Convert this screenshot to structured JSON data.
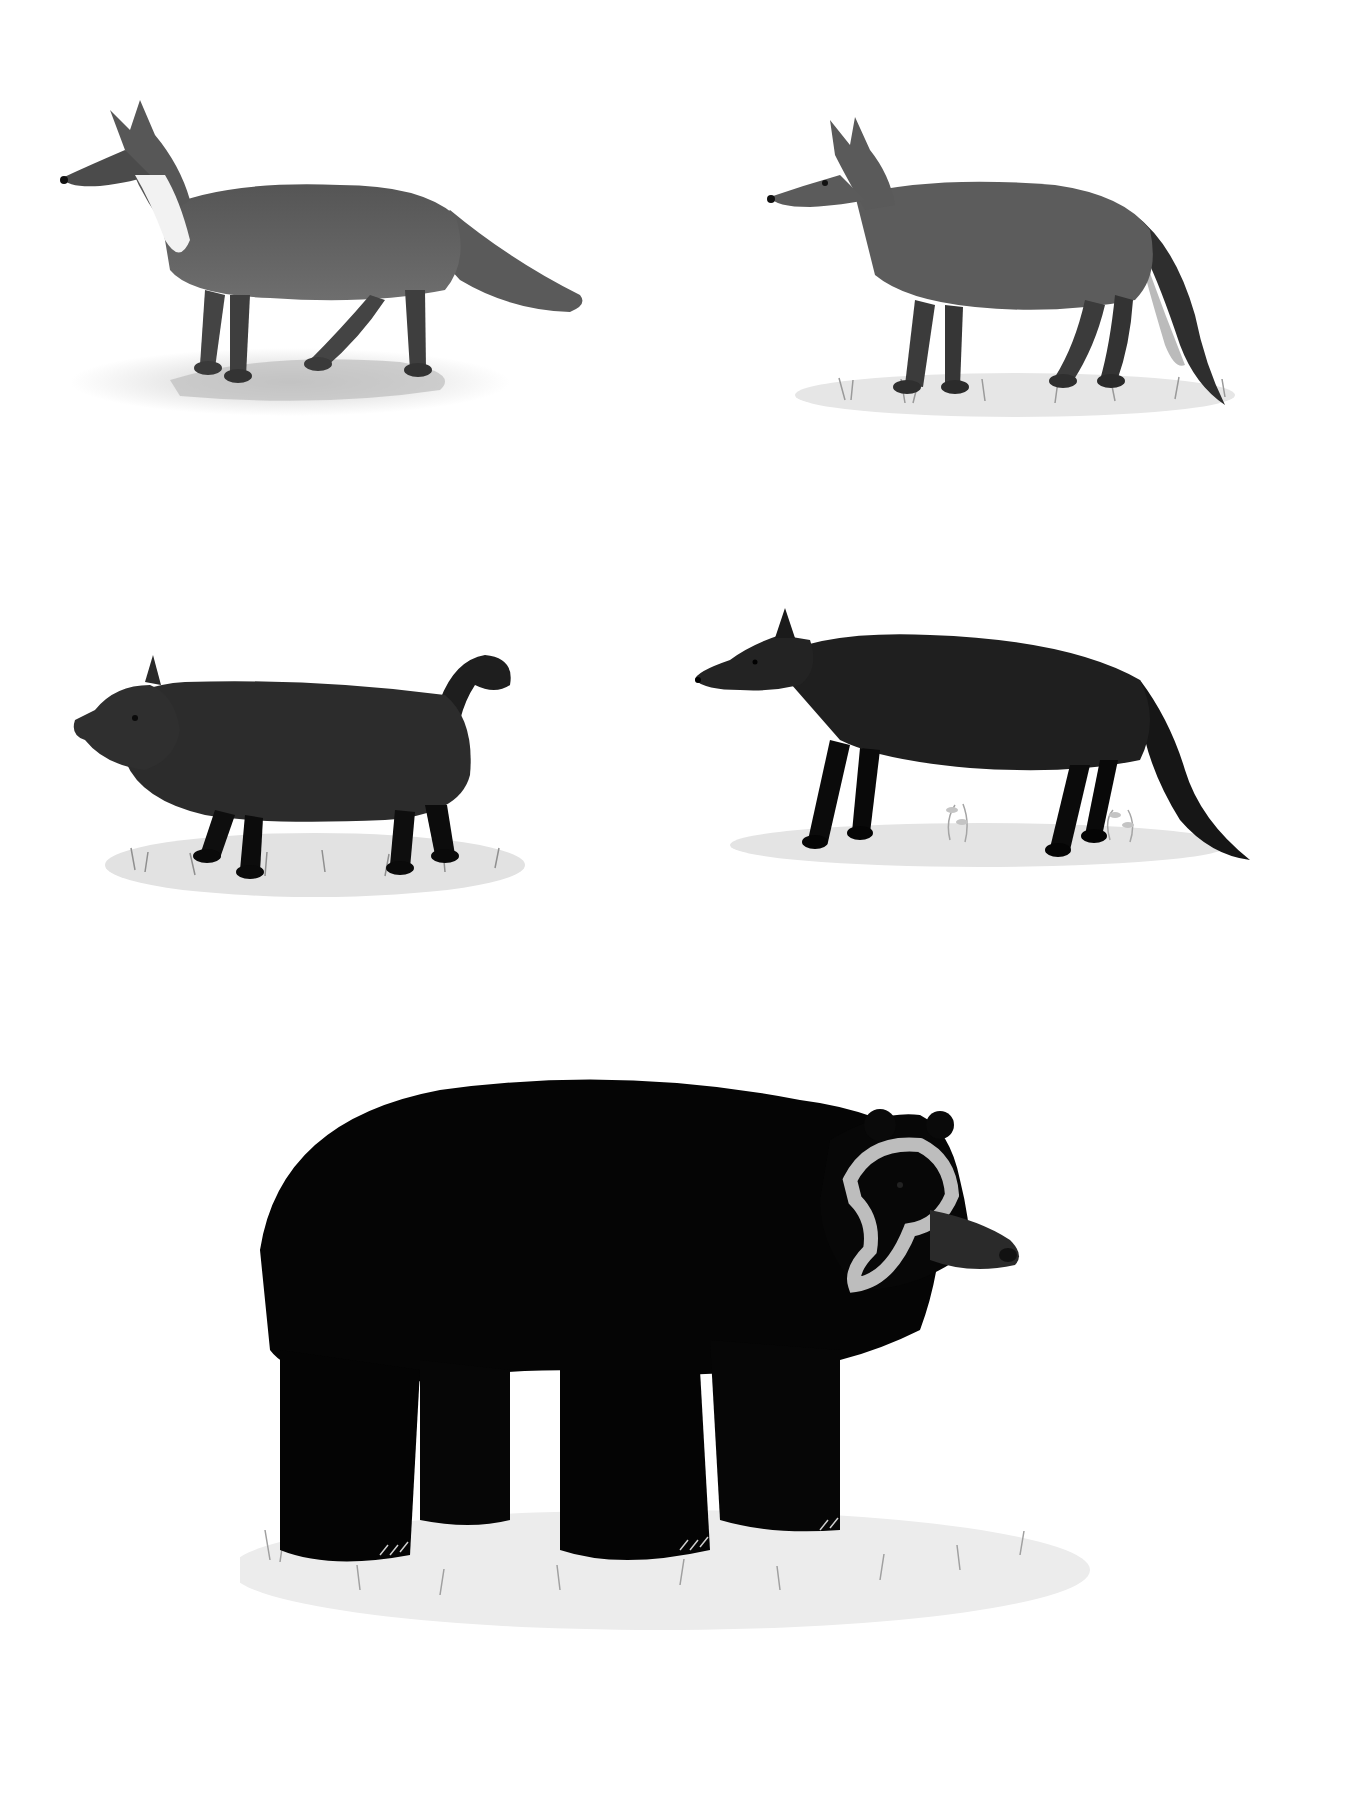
{
  "plate": {
    "background": "#ffffff",
    "palette": {
      "ink_dark": "#0a0a0a",
      "fur_mid": "#4a4a4a",
      "fur_light": "#7a7a7a",
      "ground": "#d6d6d6",
      "grass": "#9a9a9a",
      "bear_mask": "#bdbdbd"
    },
    "illustrations": [
      {
        "id": "canid-on-rock",
        "description": "grey fox standing on a flat rock, facing left, white throat, bushy tail",
        "position": "top-left"
      },
      {
        "id": "canid-on-grass",
        "description": "grey jackal-like canid standing on grass, facing left, dark-tipped tail",
        "position": "top-right"
      },
      {
        "id": "short-legged-canid",
        "description": "dark, stocky short-legged canid with short curled tail on grass, facing left",
        "position": "middle-left"
      },
      {
        "id": "dark-slender-canid",
        "description": "dark slender canid with long bushy tail on ground with small plants, facing left",
        "position": "middle-right"
      },
      {
        "id": "bear",
        "description": "large black bear with pale spectacle-like facial markings, facing right, standing on grass",
        "position": "bottom-center"
      }
    ]
  }
}
